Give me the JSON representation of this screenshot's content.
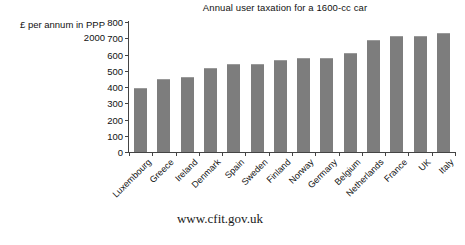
{
  "chart_data": {
    "type": "bar",
    "title": "Annual user taxation for a 1600-cc car",
    "xlabel": "",
    "ylabel": "£ per annum in PPP 2000",
    "ylabel_lines": [
      "£ per annum in PPP",
      "2000"
    ],
    "ylim": [
      0,
      800
    ],
    "ytick_step": 100,
    "yticks": [
      0,
      100,
      200,
      300,
      400,
      500,
      600,
      700,
      800
    ],
    "ytick_labels": [
      "0",
      "100",
      "200",
      "300",
      "400",
      "500",
      "600",
      "700",
      "800"
    ],
    "grid": false,
    "legend": false,
    "bar_color": "#7d7d7d",
    "categories": [
      "Luxembourg",
      "Greece",
      "Ireland",
      "Denmark",
      "Spain",
      "Sweden",
      "Finland",
      "Norway",
      "Germany",
      "Belgium",
      "Netherlands",
      "France",
      "UK",
      "Italy"
    ],
    "values": [
      395,
      450,
      460,
      515,
      540,
      540,
      565,
      580,
      580,
      610,
      690,
      715,
      715,
      730
    ]
  },
  "footer": {
    "url": "www.cfit.gov.uk"
  }
}
